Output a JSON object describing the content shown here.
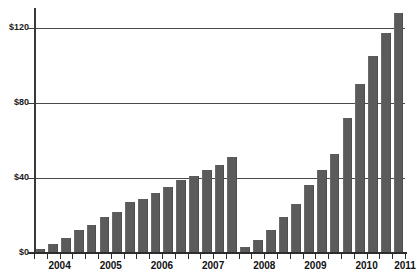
{
  "chart_data": {
    "type": "bar",
    "title": "",
    "xlabel": "",
    "ylabel": "",
    "ylim": [
      0,
      130
    ],
    "yticks": [
      0,
      40,
      80,
      120
    ],
    "ytick_labels": [
      "$0",
      "$40",
      "$80",
      "$120"
    ],
    "grid": true,
    "legend": "none",
    "year_labels": [
      "2004",
      "2005",
      "2006",
      "2007",
      "2008",
      "2009",
      "2010",
      "2011"
    ],
    "categories": [
      "2004 Q1",
      "2004 Q2",
      "2004 Q3",
      "2004 Q4",
      "2005 Q1",
      "2005 Q2",
      "2005 Q3",
      "2005 Q4",
      "2006 Q1",
      "2006 Q2",
      "2006 Q3",
      "2006 Q4",
      "2007 Q1",
      "2007 Q2",
      "2007 Q3",
      "2007 Q4",
      "2008 Q1",
      "2008 Q2",
      "2008 Q3",
      "2008 Q4",
      "2009 Q1",
      "2009 Q2",
      "2009 Q3",
      "2009 Q4",
      "2010 Q1",
      "2010 Q2",
      "2010 Q3",
      "2010 Q4",
      "2011 Q1"
    ],
    "values": [
      2,
      5,
      8,
      12,
      15,
      19,
      22,
      27,
      29,
      32,
      35,
      39,
      41,
      44,
      47,
      51,
      3,
      7,
      12,
      19,
      26,
      36,
      44,
      53,
      72,
      90,
      105,
      117,
      128
    ],
    "bar_color": "#5b5b5b",
    "grid_color": "#4a4a4a",
    "axis_color": "#2d2d2d",
    "text_color": "#111111",
    "background": "#ffffff"
  }
}
